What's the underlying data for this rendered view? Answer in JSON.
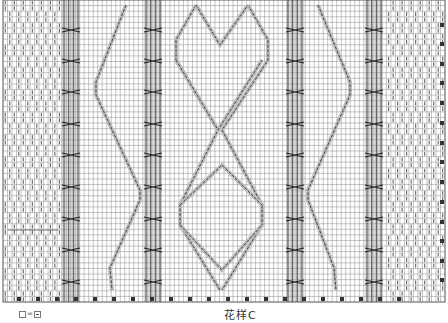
{
  "chart_title": "花样C",
  "legend": {
    "left_symbol": "□",
    "equals": "=",
    "right_symbol": "⊟",
    "meaning": "blank square = purl stitch"
  },
  "grid": {
    "x0": 3,
    "y0": 0,
    "x1": 445,
    "y1": 302,
    "cols": 98,
    "rows": 54,
    "line_color": "#555555",
    "bg_color": "#ffffff",
    "shade_color": "#c8c8c8"
  },
  "panels": {
    "seed_left": {
      "x": 3,
      "w": 58
    },
    "seed_right": {
      "x": 388,
      "w": 57
    },
    "cable_columns": [
      {
        "name": "cable-col-1",
        "x": 62,
        "w": 18
      },
      {
        "name": "cable-col-2",
        "x": 144,
        "w": 18
      },
      {
        "name": "cable-col-3",
        "x": 286,
        "w": 18
      },
      {
        "name": "cable-col-4",
        "x": 365,
        "w": 18
      }
    ],
    "cable_cross_rows_y": [
      30,
      61,
      92,
      124,
      155,
      187,
      219,
      250,
      282
    ]
  },
  "travel_lines": [
    {
      "name": "left-zigzag",
      "points": [
        [
          126,
          5
        ],
        [
          96,
          82
        ],
        [
          96,
          95
        ],
        [
          140,
          190
        ],
        [
          140,
          200
        ],
        [
          110,
          268
        ],
        [
          112,
          290
        ]
      ]
    },
    {
      "name": "right-zigzag",
      "points": [
        [
          318,
          5
        ],
        [
          350,
          82
        ],
        [
          350,
          95
        ],
        [
          308,
          190
        ],
        [
          308,
          200
        ],
        [
          334,
          268
        ],
        [
          336,
          290
        ]
      ]
    },
    {
      "name": "diamond-a",
      "points": [
        [
          196,
          5
        ],
        [
          176,
          40
        ],
        [
          176,
          60
        ],
        [
          218,
          130
        ],
        [
          180,
          205
        ],
        [
          180,
          225
        ],
        [
          220,
          290
        ]
      ]
    },
    {
      "name": "diamond-b",
      "points": [
        [
          248,
          5
        ],
        [
          268,
          40
        ],
        [
          268,
          60
        ],
        [
          222,
          130
        ],
        [
          262,
          205
        ],
        [
          262,
          225
        ],
        [
          222,
          290
        ]
      ]
    },
    {
      "name": "diamond-c",
      "points": [
        [
          196,
          5
        ],
        [
          220,
          45
        ],
        [
          248,
          5
        ]
      ]
    },
    {
      "name": "diamond-d",
      "points": [
        [
          176,
          60
        ],
        [
          218,
          130
        ],
        [
          262,
          60
        ]
      ]
    },
    {
      "name": "diamond-e",
      "points": [
        [
          180,
          205
        ],
        [
          222,
          165
        ],
        [
          262,
          205
        ]
      ]
    },
    {
      "name": "diamond-f",
      "points": [
        [
          180,
          225
        ],
        [
          222,
          270
        ],
        [
          262,
          225
        ]
      ]
    }
  ],
  "bottom_markers_x": [
    19,
    38,
    57,
    76,
    95,
    114,
    133,
    152,
    171,
    190,
    209,
    228,
    247,
    266,
    285,
    304,
    323,
    342,
    361,
    380,
    399
  ],
  "right_markers_y": [
    25,
    44,
    64,
    83,
    103,
    123,
    143,
    162,
    182,
    202,
    222,
    241,
    261,
    280
  ],
  "stray_mark": {
    "x1": 8,
    "x2": 58,
    "y": 230
  }
}
